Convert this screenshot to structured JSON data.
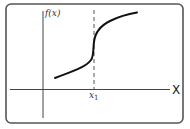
{
  "diagram": {
    "type": "function-graph",
    "y_axis_label": "f(x)",
    "x_axis_label": "X",
    "marker_label": "x",
    "marker_subscript": "1",
    "colors": {
      "frame": "#555555",
      "axes": "#444444",
      "curve": "#111111",
      "dashed_line": "#555555"
    }
  }
}
